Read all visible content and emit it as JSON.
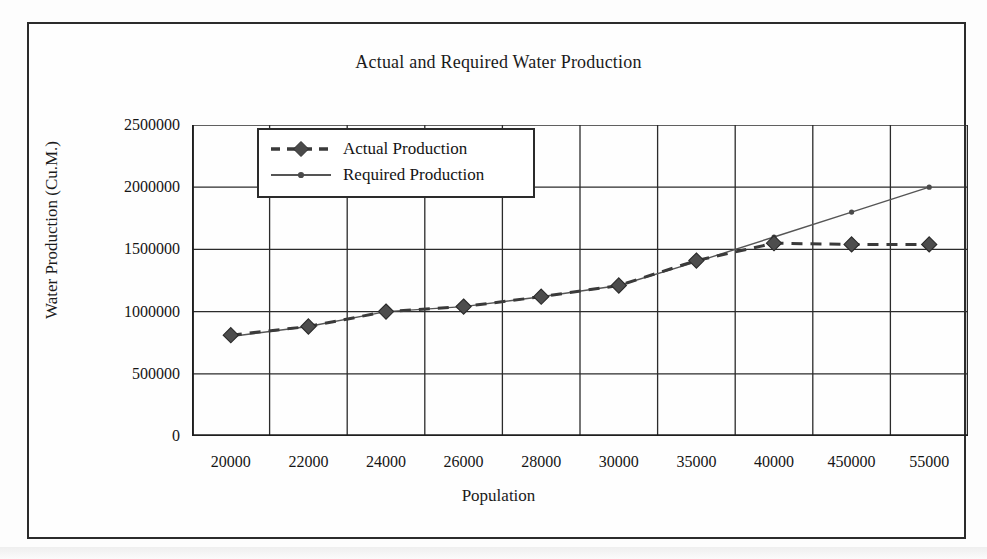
{
  "chart_data": {
    "type": "line",
    "title": "Actual and Required Water Production",
    "xlabel": "Population",
    "ylabel": "Water Production (Cu.M.)",
    "categories": [
      "20000",
      "22000",
      "24000",
      "26000",
      "28000",
      "30000",
      "35000",
      "40000",
      "450000",
      "55000"
    ],
    "yticks": [
      "0",
      "500000",
      "1000000",
      "1500000",
      "2000000",
      "2500000"
    ],
    "ylim": [
      0,
      2500000
    ],
    "grid": "both",
    "legend_position": "top-left-inside",
    "series": [
      {
        "name": "Actual Production",
        "marker": "diamond",
        "line_style": "dashed",
        "line_width": 3,
        "color": "#3a3a3a",
        "values": [
          810000,
          880000,
          1000000,
          1040000,
          1120000,
          1210000,
          1410000,
          1550000,
          1540000,
          1540000
        ]
      },
      {
        "name": "Required Production",
        "marker": "dot",
        "line_style": "solid",
        "line_width": 1.4,
        "color": "#555555",
        "values": [
          800000,
          880000,
          1000000,
          1040000,
          1120000,
          1210000,
          1400000,
          1600000,
          1800000,
          2000000
        ]
      }
    ]
  },
  "legend": {
    "items": [
      {
        "label": "Actual Production"
      },
      {
        "label": "Required Production"
      }
    ]
  }
}
